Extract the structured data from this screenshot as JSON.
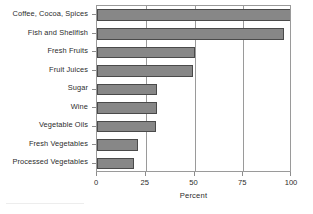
{
  "chart_data": {
    "type": "bar",
    "orientation": "horizontal",
    "title": "",
    "xlabel": "Percent",
    "ylabel": "",
    "xlim": [
      0,
      100
    ],
    "xticks": [
      0,
      25,
      50,
      75,
      100
    ],
    "xticklabels": [
      "0",
      "25",
      "50",
      "75",
      "100"
    ],
    "grid": true,
    "grid_axis": "x",
    "legend": null,
    "categories": [
      "Coffee, Cocoa, Spices",
      "Fish and Shellfish",
      "Fresh Fruits",
      "Fruit Juices",
      "Sugar",
      "Wine",
      "Vegetable Oils",
      "Fresh Vegetables",
      "Processed Vegetables"
    ],
    "values": [
      100,
      96,
      50,
      49,
      31,
      31,
      30,
      21,
      19
    ],
    "bar_color": "#878787",
    "bar_edge_color": "#4a4a4a"
  },
  "axes": {
    "frame_color": "#9a9a9a",
    "tick_color": "#8c8c8c",
    "text_color": "#2b2b2b"
  }
}
